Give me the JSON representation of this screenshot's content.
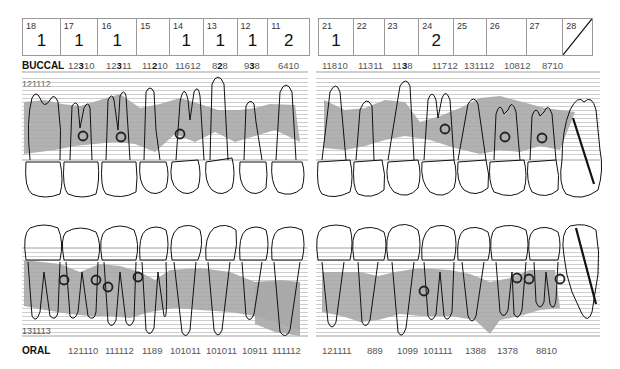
{
  "upper_right_table": {
    "cells": [
      {
        "tooth": "18",
        "value": "1"
      },
      {
        "tooth": "17",
        "value": "1"
      },
      {
        "tooth": "16",
        "value": "1"
      },
      {
        "tooth": "15",
        "value": ""
      },
      {
        "tooth": "14",
        "value": "1"
      },
      {
        "tooth": "13",
        "value": "1"
      },
      {
        "tooth": "12",
        "value": "1"
      },
      {
        "tooth": "11",
        "value": "2"
      }
    ]
  },
  "upper_left_table": {
    "cells": [
      {
        "tooth": "21",
        "value": "1"
      },
      {
        "tooth": "22",
        "value": ""
      },
      {
        "tooth": "23",
        "value": ""
      },
      {
        "tooth": "24",
        "value": "2"
      },
      {
        "tooth": "25",
        "value": ""
      },
      {
        "tooth": "26",
        "value": ""
      },
      {
        "tooth": "27",
        "value": ""
      },
      {
        "tooth": "28",
        "value": "",
        "missing": true
      }
    ]
  },
  "buccal": {
    "label": "BUCCAL",
    "scale_label": "121112",
    "right_values": [
      {
        "pre": "12",
        "bold": "3",
        "post": "10"
      },
      {
        "pre": "12",
        "bold": "3",
        "post": "11"
      },
      {
        "pre": "11",
        "bold": "2",
        "post": "10"
      },
      {
        "pre": "11612",
        "bold": "",
        "post": ""
      },
      {
        "pre": "8",
        "bold": "2",
        "post": "8"
      },
      {
        "pre": "9",
        "bold": "3",
        "post": "8"
      },
      {
        "pre": "6410",
        "bold": "",
        "post": ""
      }
    ],
    "left_values": [
      {
        "pre": "11810",
        "bold": "",
        "post": ""
      },
      {
        "pre": "11311",
        "bold": "",
        "post": ""
      },
      {
        "pre": "11",
        "bold": "3",
        "post": "8"
      },
      {
        "pre": "11712",
        "bold": "",
        "post": ""
      },
      {
        "pre": "131112",
        "bold": "",
        "post": ""
      },
      {
        "pre": "10812",
        "bold": "",
        "post": ""
      },
      {
        "pre": "8710",
        "bold": "",
        "post": ""
      }
    ]
  },
  "oral": {
    "label": "ORAL",
    "scale_label": "131113",
    "right_values": [
      "121110",
      "111112",
      "1189",
      "101011",
      "101011",
      "10911",
      "111112"
    ],
    "left_values": [
      "121111",
      "889",
      "1099",
      "101111",
      "1388",
      "1378",
      "8810"
    ]
  },
  "colors": {
    "bone_fill": "#a8a8a8",
    "grid_line": "#b8b8b8",
    "outline": "#111111",
    "border": "#9a9a9a"
  }
}
